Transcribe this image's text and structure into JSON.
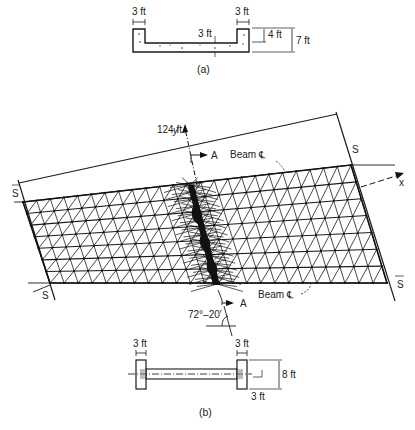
{
  "figure": {
    "section_a": {
      "caption": "(a)",
      "labels": {
        "left_wall_width": "3 ft",
        "right_wall_width": "3 ft",
        "slab_thickness": "3 ft",
        "inner_depth": "4 ft",
        "total_depth": "7 ft"
      }
    },
    "plan": {
      "span_label": "124 ft",
      "axis_x": "x",
      "axis_y": "y",
      "section_marker_top": "A",
      "section_marker_bottom": "A",
      "beam_cl_top": "Beam ℄",
      "beam_cl_bottom": "Beam ℄",
      "support_labels": [
        "S",
        "S",
        "S",
        "S"
      ],
      "skew_angle": "72°–20′"
    },
    "section_b": {
      "caption": "(b)",
      "labels": {
        "left_beam_width": "3 ft",
        "right_beam_width": "3 ft",
        "beam_depth": "8 ft",
        "slab_offset": "3 ft"
      }
    }
  }
}
